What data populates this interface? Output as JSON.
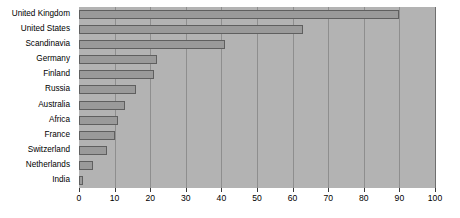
{
  "chart_data": {
    "type": "bar",
    "orientation": "horizontal",
    "title": "",
    "xlabel": "",
    "ylabel": "",
    "categories": [
      "United Kingdom",
      "United States",
      "Scandinavia",
      "Germany",
      "Finland",
      "Russia",
      "Australia",
      "Africa",
      "France",
      "Switzerland",
      "Netherlands",
      "India"
    ],
    "values": [
      90,
      63,
      41,
      22,
      21,
      16,
      13,
      11,
      10,
      8,
      4,
      1
    ],
    "xlim": [
      0,
      100
    ],
    "xticks": [
      0,
      10,
      20,
      30,
      40,
      50,
      60,
      70,
      80,
      90,
      100
    ],
    "xtick_labels": [
      "0",
      "10",
      "20",
      "30",
      "40",
      "50",
      "60",
      "70",
      "80",
      "90",
      "100"
    ],
    "grid": "vertical",
    "legend": "none",
    "colors": {
      "bar_fill": "#9a9a9a",
      "bar_edge": "#5f5f5f",
      "plot_background": "#b3b3b3",
      "gridline": "#6f6f6f",
      "text": "#000000",
      "page_background": "#ffffff"
    }
  }
}
